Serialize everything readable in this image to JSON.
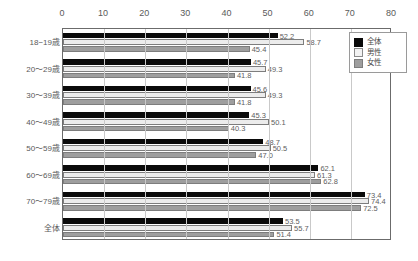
{
  "chart_data": {
    "type": "bar",
    "orientation": "horizontal",
    "title": "",
    "xlabel": "",
    "ylabel": "",
    "xlim": [
      0,
      80
    ],
    "xticks": [
      0,
      10,
      20,
      30,
      40,
      50,
      60,
      70,
      80
    ],
    "grid": true,
    "legend_position": "top-right",
    "categories": [
      "18−19歳",
      "20～29歳",
      "30～39歳",
      "40～49歳",
      "50～59歳",
      "60～69歳",
      "70～79歳",
      "全体"
    ],
    "series": [
      {
        "name": "全体",
        "color": "#0a0a0a",
        "values": [
          52.2,
          45.7,
          45.6,
          45.3,
          48.7,
          62.1,
          73.4,
          53.5
        ],
        "labels": [
          "52.2",
          "45.7",
          "45.6",
          "45.3",
          "48.7",
          "62.1",
          "73.4",
          "53.5"
        ]
      },
      {
        "name": "男性",
        "color": "#ececec",
        "values": [
          58.7,
          49.3,
          49.3,
          50.1,
          50.5,
          61.3,
          74.4,
          55.7
        ],
        "labels": [
          "58.7",
          "49.3",
          "49.3",
          "50.1",
          "50.5",
          "61.3",
          "74.4",
          "55.7"
        ]
      },
      {
        "name": "女性",
        "color": "#9e9e9e",
        "values": [
          45.4,
          41.8,
          41.8,
          40.3,
          47.0,
          62.8,
          72.5,
          51.4
        ],
        "labels": [
          "45.4",
          "41.8",
          "41.8",
          "40.3",
          "47.0",
          "62.8",
          "72.5",
          "51.4"
        ]
      }
    ]
  },
  "legend": {
    "items": [
      {
        "label": "全体"
      },
      {
        "label": "男性"
      },
      {
        "label": "女性"
      }
    ]
  }
}
